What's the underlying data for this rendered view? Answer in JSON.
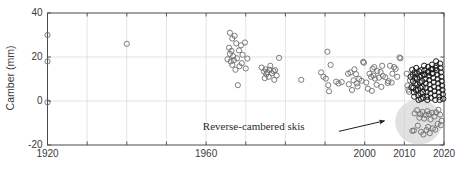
{
  "chart_data": {
    "type": "scatter",
    "title": "",
    "xlabel": "",
    "ylabel": "Camber (mm)",
    "xlim": [
      1920,
      2020
    ],
    "ylim": [
      -20,
      40
    ],
    "grid": true,
    "legend": null,
    "x_ticks": [
      1920,
      1930,
      1940,
      1950,
      1960,
      1970,
      1980,
      1990,
      2000,
      2010,
      2020
    ],
    "x_tick_labels": [
      "1920",
      "",
      "",
      "",
      "1960",
      "",
      "",
      "",
      "2000",
      "2010",
      "2020"
    ],
    "x_labeled_ticks": [
      {
        "value": 1920,
        "label": "1920"
      },
      {
        "value": 1960,
        "label": "1960"
      },
      {
        "value": 2000,
        "label": "2000"
      },
      {
        "value": 2010,
        "label": "2010"
      },
      {
        "value": 2020,
        "label": "2020"
      }
    ],
    "y_ticks": [
      -20,
      0,
      20,
      40
    ],
    "y_tick_labels": [
      "-20",
      "0",
      "20",
      "40"
    ],
    "marker": "open-circle",
    "marker_color": "#6e6e6e",
    "dense_marker_color": "#1c1c1c",
    "annotations": [
      {
        "text": "Reverse-cambered skis",
        "text_x": 1972,
        "text_y": -13.2,
        "arrow_from_x": 1993.5,
        "arrow_from_y": -13.8,
        "arrow_to_x": 2005.0,
        "arrow_to_y": -9.0
      }
    ],
    "highlight_region": {
      "shape": "ellipse",
      "label": "reverse-camber-zone",
      "center_x": 2013.6,
      "center_y": -9.5,
      "radius_x": 5.9,
      "radius_y": 10.2,
      "fill": "#cfcfcf",
      "opacity": 0.62
    },
    "series": [
      {
        "name": "Ski camber measurements",
        "points": [
          [
            1920,
            30.0
          ],
          [
            1920,
            18.0
          ],
          [
            1920,
            -0.6
          ],
          [
            1940,
            26.0
          ],
          [
            1966,
            31.0
          ],
          [
            1966.6,
            28.4
          ],
          [
            1967.2,
            29.6
          ],
          [
            1967.6,
            26.2
          ],
          [
            1965.8,
            24.2
          ],
          [
            1966.4,
            22.8
          ],
          [
            1966.0,
            21.4
          ],
          [
            1966.8,
            20.4
          ],
          [
            1965.4,
            19.0
          ],
          [
            1966.2,
            18.0
          ],
          [
            1967.0,
            18.6
          ],
          [
            1967.8,
            19.4
          ],
          [
            1968.3,
            23.0
          ],
          [
            1968.8,
            25.3
          ],
          [
            1969.2,
            21.0
          ],
          [
            1969.0,
            17.2
          ],
          [
            1968.4,
            15.8
          ],
          [
            1967.4,
            14.2
          ],
          [
            1966.6,
            16.4
          ],
          [
            1969.8,
            26.6
          ],
          [
            1970.4,
            19.3
          ],
          [
            1970.0,
            14.8
          ],
          [
            1968.0,
            7.2
          ],
          [
            1974.0,
            15.2
          ],
          [
            1974.6,
            13.4
          ],
          [
            1975.0,
            14.4
          ],
          [
            1975.4,
            13.1
          ],
          [
            1975.2,
            12.2
          ],
          [
            1976.0,
            14.2
          ],
          [
            1976.6,
            12.6
          ],
          [
            1975.8,
            11.0
          ],
          [
            1974.8,
            10.4
          ],
          [
            1976.2,
            16.0
          ],
          [
            1977.0,
            13.6
          ],
          [
            1977.4,
            14.0
          ],
          [
            1978.4,
            19.6
          ],
          [
            1977.8,
            11.6
          ],
          [
            1977.2,
            9.6
          ],
          [
            1984.0,
            9.6
          ],
          [
            1989.0,
            13.0
          ],
          [
            1989.6,
            11.0
          ],
          [
            1990.6,
            22.4
          ],
          [
            1991.4,
            16.4
          ],
          [
            1990.2,
            10.2
          ],
          [
            1990.8,
            7.2
          ],
          [
            1991.0,
            4.4
          ],
          [
            1992.8,
            8.8
          ],
          [
            1993.4,
            8.0
          ],
          [
            1994.2,
            8.6
          ],
          [
            1995.8,
            12.4
          ],
          [
            1996.4,
            13.0
          ],
          [
            1996.0,
            7.6
          ],
          [
            1996.8,
            5.0
          ],
          [
            1997.4,
            14.4
          ],
          [
            1997.8,
            12.2
          ],
          [
            1997.2,
            9.4
          ],
          [
            1998.0,
            8.0
          ],
          [
            1998.6,
            10.0
          ],
          [
            1998.2,
            6.6
          ],
          [
            1999.2,
            9.2
          ],
          [
            1999.6,
            17.8
          ],
          [
            1999.8,
            17.4
          ],
          [
            2000.4,
            8.4
          ],
          [
            2000.8,
            5.6
          ],
          [
            2001.2,
            12.4
          ],
          [
            2001.6,
            11.0
          ],
          [
            2002.0,
            14.6
          ],
          [
            2002.4,
            15.4
          ],
          [
            2002.2,
            11.6
          ],
          [
            2002.6,
            10.2
          ],
          [
            2001.8,
            4.6
          ],
          [
            2003.2,
            13.6
          ],
          [
            2003.6,
            10.6
          ],
          [
            2003.0,
            7.4
          ],
          [
            2004.4,
            16.0
          ],
          [
            2004.0,
            13.2
          ],
          [
            2004.6,
            11.4
          ],
          [
            2004.2,
            6.4
          ],
          [
            2005.2,
            10.8
          ],
          [
            2005.8,
            8.2
          ],
          [
            2006.4,
            16.0
          ],
          [
            2006.0,
            9.0
          ],
          [
            2006.8,
            8.4
          ],
          [
            2007.4,
            15.4
          ],
          [
            2007.0,
            12.4
          ],
          [
            2007.8,
            14.6
          ],
          [
            2008.2,
            11.0
          ],
          [
            2008.8,
            19.8
          ],
          [
            2009.0,
            19.4
          ],
          [
            2010.6,
            12.4
          ],
          [
            2010.8,
            7.0
          ],
          [
            2011.0,
            5.2
          ],
          [
            2011.2,
            4.2
          ],
          [
            2011.4,
            9.4
          ],
          [
            2011.6,
            11.0
          ],
          [
            2011.8,
            6.2
          ],
          [
            2012.0,
            14.2
          ],
          [
            2012.1,
            12.0
          ],
          [
            2012.2,
            9.0
          ],
          [
            2012.3,
            6.0
          ],
          [
            2012.4,
            4.0
          ],
          [
            2012.5,
            2.0
          ],
          [
            2012.6,
            13.0
          ],
          [
            2012.7,
            10.5
          ],
          [
            2012.8,
            8.0
          ],
          [
            2012.9,
            5.0
          ],
          [
            2013.0,
            15.0
          ],
          [
            2013.1,
            12.5
          ],
          [
            2013.2,
            10.0
          ],
          [
            2013.3,
            7.5
          ],
          [
            2013.4,
            5.0
          ],
          [
            2013.5,
            2.5
          ],
          [
            2013.6,
            0.5
          ],
          [
            2013.7,
            13.5
          ],
          [
            2013.8,
            11.0
          ],
          [
            2013.9,
            8.5
          ],
          [
            2014.0,
            6.0
          ],
          [
            2014.1,
            3.5
          ],
          [
            2014.2,
            1.0
          ],
          [
            2014.3,
            14.0
          ],
          [
            2014.4,
            11.5
          ],
          [
            2014.5,
            9.0
          ],
          [
            2014.6,
            6.5
          ],
          [
            2014.7,
            4.0
          ],
          [
            2014.8,
            1.5
          ],
          [
            2014.9,
            12.0
          ],
          [
            2015.0,
            16.0
          ],
          [
            2015.1,
            14.0
          ],
          [
            2015.2,
            12.0
          ],
          [
            2015.3,
            10.0
          ],
          [
            2015.4,
            8.0
          ],
          [
            2015.5,
            6.0
          ],
          [
            2015.6,
            4.0
          ],
          [
            2015.7,
            2.0
          ],
          [
            2015.8,
            0.5
          ],
          [
            2015.9,
            13.0
          ],
          [
            2016.0,
            15.5
          ],
          [
            2016.1,
            13.5
          ],
          [
            2016.2,
            11.5
          ],
          [
            2016.3,
            9.5
          ],
          [
            2016.4,
            7.5
          ],
          [
            2016.5,
            5.5
          ],
          [
            2016.6,
            3.5
          ],
          [
            2016.7,
            1.5
          ],
          [
            2016.8,
            14.5
          ],
          [
            2016.9,
            12.5
          ],
          [
            2017.0,
            16.5
          ],
          [
            2017.1,
            14.5
          ],
          [
            2017.2,
            12.5
          ],
          [
            2017.3,
            10.5
          ],
          [
            2017.4,
            8.5
          ],
          [
            2017.5,
            6.5
          ],
          [
            2017.6,
            4.5
          ],
          [
            2017.7,
            2.5
          ],
          [
            2017.8,
            0.5
          ],
          [
            2017.9,
            15.0
          ],
          [
            2018.0,
            18.0
          ],
          [
            2018.1,
            16.0
          ],
          [
            2018.2,
            14.0
          ],
          [
            2018.3,
            12.0
          ],
          [
            2018.4,
            10.0
          ],
          [
            2018.5,
            8.0
          ],
          [
            2018.6,
            6.0
          ],
          [
            2018.7,
            4.0
          ],
          [
            2018.8,
            2.0
          ],
          [
            2018.9,
            0.5
          ],
          [
            2019.0,
            17.0
          ],
          [
            2019.1,
            15.0
          ],
          [
            2019.2,
            13.0
          ],
          [
            2019.3,
            11.0
          ],
          [
            2019.4,
            9.0
          ],
          [
            2019.5,
            7.0
          ],
          [
            2019.6,
            5.0
          ],
          [
            2019.7,
            3.0
          ],
          [
            2019.8,
            1.0
          ],
          [
            2012.6,
            -5.6
          ],
          [
            2013.2,
            -4.2
          ],
          [
            2013.8,
            -7.6
          ],
          [
            2014.0,
            -6.0
          ],
          [
            2014.6,
            -5.0
          ],
          [
            2015.0,
            -8.0
          ],
          [
            2015.4,
            -6.4
          ],
          [
            2015.8,
            -4.6
          ],
          [
            2016.2,
            -6.0
          ],
          [
            2016.6,
            -8.4
          ],
          [
            2017.0,
            -5.4
          ],
          [
            2017.6,
            -7.0
          ],
          [
            2018.0,
            -5.2
          ],
          [
            2018.6,
            -4.0
          ],
          [
            2019.0,
            -6.2
          ],
          [
            2019.4,
            -9.0
          ],
          [
            2012.0,
            -13.6
          ],
          [
            2012.4,
            -13.4
          ],
          [
            2014.2,
            -14.0
          ],
          [
            2014.8,
            -15.2
          ],
          [
            2015.6,
            -13.2
          ],
          [
            2016.4,
            -14.6
          ],
          [
            2017.2,
            -12.4
          ],
          [
            2018.4,
            -10.4
          ],
          [
            2019.2,
            -11.0
          ],
          [
            2013.4,
            -11.2
          ],
          [
            2016.0,
            -11.8
          ],
          [
            2017.8,
            -13.0
          ]
        ]
      }
    ]
  },
  "axes": {
    "y_axis_title": "Camber (mm)"
  }
}
